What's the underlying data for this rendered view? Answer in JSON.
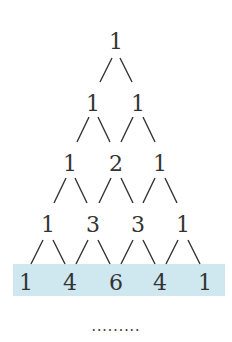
{
  "highlight_color": "#cfe8ef",
  "rows": [
    [
      "1"
    ],
    [
      "1",
      "1"
    ],
    [
      "1",
      "2",
      "1"
    ],
    [
      "1",
      "3",
      "3",
      "1"
    ],
    [
      "1",
      "4",
      "6",
      "4",
      "1"
    ]
  ],
  "highlighted_row": 4,
  "continuation": "........."
}
